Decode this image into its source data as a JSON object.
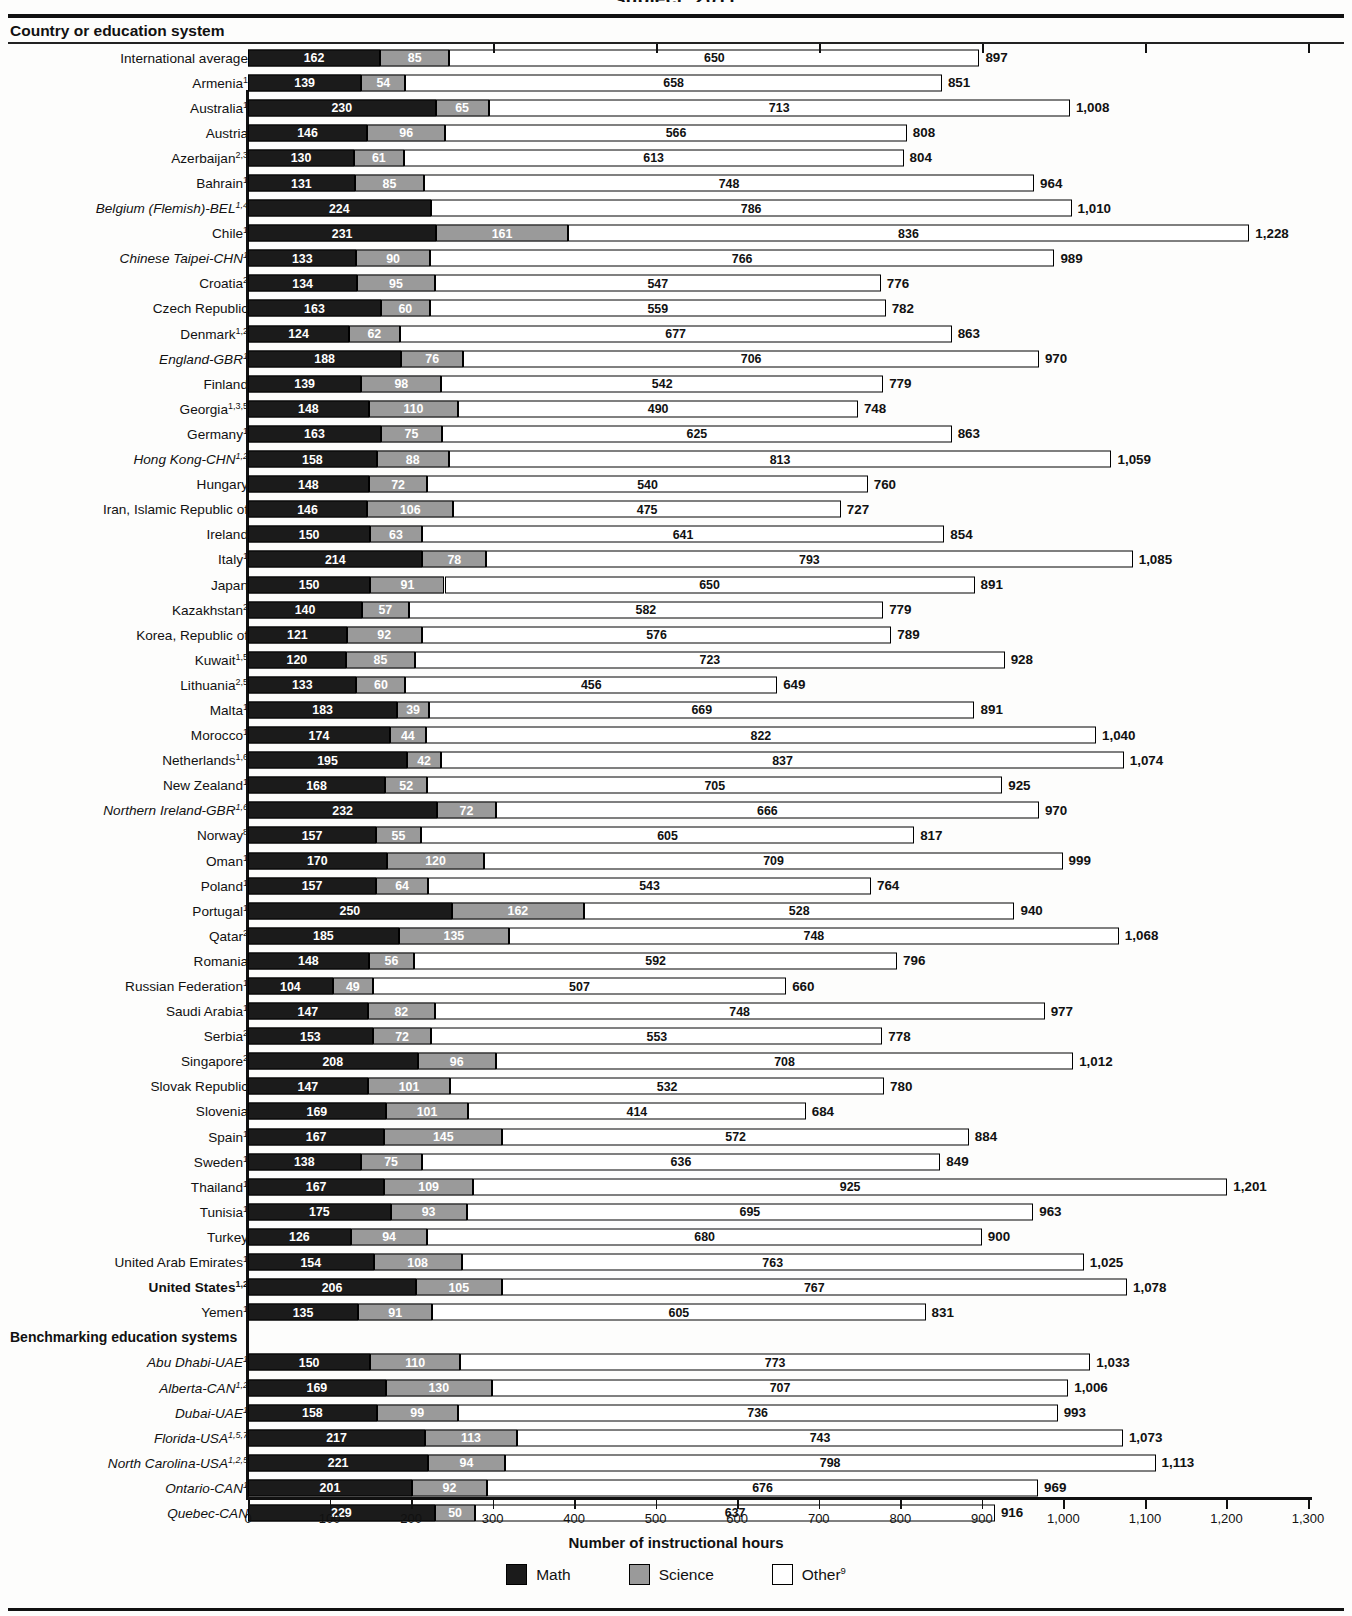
{
  "clipped_title": "subject: 2011",
  "column_header": "Country or education system",
  "axis": {
    "title": "Number of instructional hours",
    "ticks": [
      "0",
      "100",
      "200",
      "300",
      "400",
      "500",
      "600",
      "700",
      "800",
      "900",
      "1,000",
      "1,100",
      "1,200",
      "1,300"
    ],
    "min": 0,
    "max": 1300
  },
  "legend": [
    {
      "key": "math",
      "label": "Math",
      "color": "#1b1b1b",
      "sup": ""
    },
    {
      "key": "science",
      "label": "Science",
      "color": "#9a9a9a",
      "sup": ""
    },
    {
      "key": "other",
      "label": "Other",
      "color": "#ffffff",
      "sup": "9"
    }
  ],
  "group_header": "Benchmarking education systems",
  "chart_data": {
    "type": "bar",
    "subtype": "stacked-horizontal",
    "xlabel": "Number of instructional hours",
    "ylabel": "Country or education system",
    "xlim": [
      0,
      1300
    ],
    "grid": false,
    "legend_position": "bottom",
    "series": [
      {
        "name": "Math",
        "color": "#1b1b1b"
      },
      {
        "name": "Science",
        "color": "#9a9a9a"
      },
      {
        "name": "Other",
        "color": "#ffffff"
      }
    ],
    "categories": [
      "International average",
      "Armenia",
      "Australia",
      "Austria",
      "Azerbaijan",
      "Bahrain",
      "Belgium (Flemish)-BEL",
      "Chile",
      "Chinese Taipei-CHN",
      "Croatia",
      "Czech Republic",
      "Denmark",
      "England-GBR",
      "Finland",
      "Georgia",
      "Germany",
      "Hong Kong-CHN",
      "Hungary",
      "Iran, Islamic Republic of",
      "Ireland",
      "Italy",
      "Japan",
      "Kazakhstan",
      "Korea, Republic of",
      "Kuwait",
      "Lithuania",
      "Malta",
      "Morocco",
      "Netherlands",
      "New Zealand",
      "Northern Ireland-GBR",
      "Norway",
      "Oman",
      "Poland",
      "Portugal",
      "Qatar",
      "Romania",
      "Russian Federation",
      "Saudi Arabia",
      "Serbia",
      "Singapore",
      "Slovak Republic",
      "Slovenia",
      "Spain",
      "Sweden",
      "Thailand",
      "Tunisia",
      "Turkey",
      "United Arab Emirates",
      "United States",
      "Yemen",
      "Abu Dhabi-UAE",
      "Alberta-CAN",
      "Dubai-UAE",
      "Florida-USA",
      "North Carolina-USA",
      "Ontario-CAN",
      "Quebec-CAN"
    ],
    "rows": [
      {
        "label": "International average",
        "sup": "",
        "style": "plain",
        "math": 162,
        "science": 85,
        "other": 650,
        "total": 897
      },
      {
        "label": "Armenia",
        "sup": "1",
        "style": "plain",
        "math": 139,
        "science": 54,
        "other": 658,
        "total": 851
      },
      {
        "label": "Australia",
        "sup": "1",
        "style": "plain",
        "math": 230,
        "science": 65,
        "other": 713,
        "total": "1,008"
      },
      {
        "label": "Austria",
        "sup": "",
        "style": "plain",
        "math": 146,
        "science": 96,
        "other": 566,
        "total": 808
      },
      {
        "label": "Azerbaijan",
        "sup": "2,3",
        "style": "plain",
        "math": 130,
        "science": 61,
        "other": 613,
        "total": 804
      },
      {
        "label": "Bahrain",
        "sup": "1",
        "style": "plain",
        "math": 131,
        "science": 85,
        "other": 748,
        "total": 964
      },
      {
        "label": "Belgium (Flemish)-BEL",
        "sup": "1,4",
        "style": "ital",
        "math": 224,
        "science": 0,
        "other": 786,
        "total": "1,010"
      },
      {
        "label": "Chile",
        "sup": "1",
        "style": "plain",
        "math": 231,
        "science": 161,
        "other": 836,
        "total": "1,228"
      },
      {
        "label": "Chinese Taipei-CHN",
        "sup": "1",
        "style": "ital",
        "math": 133,
        "science": 90,
        "other": 766,
        "total": 989
      },
      {
        "label": "Croatia",
        "sup": "2",
        "style": "plain",
        "math": 134,
        "science": 95,
        "other": 547,
        "total": 776
      },
      {
        "label": "Czech Republic",
        "sup": "",
        "style": "plain",
        "math": 163,
        "science": 60,
        "other": 559,
        "total": 782
      },
      {
        "label": "Denmark",
        "sup": "1,2",
        "style": "plain",
        "math": 124,
        "science": 62,
        "other": 677,
        "total": 863
      },
      {
        "label": "England-GBR",
        "sup": "1",
        "style": "ital",
        "math": 188,
        "science": 76,
        "other": 706,
        "total": 970
      },
      {
        "label": "Finland",
        "sup": "",
        "style": "plain",
        "math": 139,
        "science": 98,
        "other": 542,
        "total": 779
      },
      {
        "label": "Georgia",
        "sup": "1,3,5",
        "style": "plain",
        "math": 148,
        "science": 110,
        "other": 490,
        "total": 748
      },
      {
        "label": "Germany",
        "sup": "1",
        "style": "plain",
        "math": 163,
        "science": 75,
        "other": 625,
        "total": 863
      },
      {
        "label": "Hong Kong-CHN",
        "sup": "1,2",
        "style": "ital",
        "math": 158,
        "science": 88,
        "other": 813,
        "total": "1,059"
      },
      {
        "label": "Hungary",
        "sup": "",
        "style": "plain",
        "math": 148,
        "science": 72,
        "other": 540,
        "total": 760
      },
      {
        "label": "Iran, Islamic Republic of",
        "sup": "",
        "style": "plain",
        "math": 146,
        "science": 106,
        "other": 475,
        "total": 727
      },
      {
        "label": "Ireland",
        "sup": "",
        "style": "plain",
        "math": 150,
        "science": 63,
        "other": 641,
        "total": 854
      },
      {
        "label": "Italy",
        "sup": "1",
        "style": "plain",
        "math": 214,
        "science": 78,
        "other": 793,
        "total": "1,085"
      },
      {
        "label": "Japan",
        "sup": "",
        "style": "plain",
        "math": 150,
        "science": 91,
        "other": 650,
        "total": 891
      },
      {
        "label": "Kazakhstan",
        "sup": "2",
        "style": "plain",
        "math": 140,
        "science": 57,
        "other": 582,
        "total": 779
      },
      {
        "label": "Korea, Republic of",
        "sup": "",
        "style": "plain",
        "math": 121,
        "science": 92,
        "other": 576,
        "total": 789
      },
      {
        "label": "Kuwait",
        "sup": "1,5",
        "style": "plain",
        "math": 120,
        "science": 85,
        "other": 723,
        "total": 928
      },
      {
        "label": "Lithuania",
        "sup": "2,5",
        "style": "plain",
        "math": 133,
        "science": 60,
        "other": 456,
        "total": 649
      },
      {
        "label": "Malta",
        "sup": "1",
        "style": "plain",
        "math": 183,
        "science": 39,
        "other": 669,
        "total": 891
      },
      {
        "label": "Morocco",
        "sup": "1",
        "style": "plain",
        "math": 174,
        "science": 44,
        "other": 822,
        "total": "1,040"
      },
      {
        "label": "Netherlands",
        "sup": "1,6",
        "style": "plain",
        "math": 195,
        "science": 42,
        "other": 837,
        "total": "1,074"
      },
      {
        "label": "New Zealand",
        "sup": "1",
        "style": "plain",
        "math": 168,
        "science": 52,
        "other": 705,
        "total": 925
      },
      {
        "label": "Northern Ireland-GBR",
        "sup": "1,6",
        "style": "ital",
        "math": 232,
        "science": 72,
        "other": 666,
        "total": 970
      },
      {
        "label": "Norway",
        "sup": "8",
        "style": "plain",
        "math": 157,
        "science": 55,
        "other": 605,
        "total": 817
      },
      {
        "label": "Oman",
        "sup": "1",
        "style": "plain",
        "math": 170,
        "science": 120,
        "other": 709,
        "total": 999
      },
      {
        "label": "Poland",
        "sup": "1",
        "style": "plain",
        "math": 157,
        "science": 64,
        "other": 543,
        "total": 764
      },
      {
        "label": "Portugal",
        "sup": "1",
        "style": "plain",
        "math": 250,
        "science": 162,
        "other": 528,
        "total": 940
      },
      {
        "label": "Qatar",
        "sup": "2",
        "style": "plain",
        "math": 185,
        "science": 135,
        "other": 748,
        "total": "1,068"
      },
      {
        "label": "Romania",
        "sup": "",
        "style": "plain",
        "math": 148,
        "science": 56,
        "other": 592,
        "total": 796
      },
      {
        "label": "Russian Federation",
        "sup": "1",
        "style": "plain",
        "math": 104,
        "science": 49,
        "other": 507,
        "total": 660
      },
      {
        "label": "Saudi Arabia",
        "sup": "1",
        "style": "plain",
        "math": 147,
        "science": 82,
        "other": 748,
        "total": 977
      },
      {
        "label": "Serbia",
        "sup": "2",
        "style": "plain",
        "math": 153,
        "science": 72,
        "other": 553,
        "total": 778
      },
      {
        "label": "Singapore",
        "sup": "2",
        "style": "plain",
        "math": 208,
        "science": 96,
        "other": 708,
        "total": "1,012"
      },
      {
        "label": "Slovak Republic",
        "sup": "",
        "style": "plain",
        "math": 147,
        "science": 101,
        "other": 532,
        "total": 780
      },
      {
        "label": "Slovenia",
        "sup": "",
        "style": "plain",
        "math": 169,
        "science": 101,
        "other": 414,
        "total": 684
      },
      {
        "label": "Spain",
        "sup": "1",
        "style": "plain",
        "math": 167,
        "science": 145,
        "other": 572,
        "total": 884
      },
      {
        "label": "Sweden",
        "sup": "1",
        "style": "plain",
        "math": 138,
        "science": 75,
        "other": 636,
        "total": 849
      },
      {
        "label": "Thailand",
        "sup": "1",
        "style": "plain",
        "math": 167,
        "science": 109,
        "other": 925,
        "total": "1,201"
      },
      {
        "label": "Tunisia",
        "sup": "1",
        "style": "plain",
        "math": 175,
        "science": 93,
        "other": 695,
        "total": 963
      },
      {
        "label": "Turkey",
        "sup": "",
        "style": "plain",
        "math": 126,
        "science": 94,
        "other": 680,
        "total": 900
      },
      {
        "label": "United Arab Emirates",
        "sup": "1",
        "style": "plain",
        "math": 154,
        "science": 108,
        "other": 763,
        "total": "1,025"
      },
      {
        "label": "United States",
        "sup": "1,2",
        "style": "bold",
        "math": 206,
        "science": 105,
        "other": 767,
        "total": "1,078"
      },
      {
        "label": "Yemen",
        "sup": "1",
        "style": "plain",
        "math": 135,
        "science": 91,
        "other": 605,
        "total": 831
      },
      {
        "label": "__GROUP__",
        "sup": "",
        "style": "group",
        "math": 0,
        "science": 0,
        "other": 0,
        "total": ""
      },
      {
        "label": "Abu Dhabi-UAE",
        "sup": "1",
        "style": "ital",
        "math": 150,
        "science": 110,
        "other": 773,
        "total": "1,033"
      },
      {
        "label": "Alberta-CAN",
        "sup": "1,2",
        "style": "ital",
        "math": 169,
        "science": 130,
        "other": 707,
        "total": "1,006"
      },
      {
        "label": "Dubai-UAE",
        "sup": "1",
        "style": "ital",
        "math": 158,
        "science": 99,
        "other": 736,
        "total": 993
      },
      {
        "label": "Florida-USA",
        "sup": "1,5,7",
        "style": "ital",
        "math": 217,
        "science": 113,
        "other": 743,
        "total": "1,073"
      },
      {
        "label": "North Carolina-USA",
        "sup": "1,2,5",
        "style": "ital",
        "math": 221,
        "science": 94,
        "other": 798,
        "total": "1,113"
      },
      {
        "label": "Ontario-CAN",
        "sup": "1",
        "style": "ital",
        "math": 201,
        "science": 92,
        "other": 676,
        "total": 969
      },
      {
        "label": "Quebec-CAN",
        "sup": "",
        "style": "ital",
        "math": 229,
        "science": 50,
        "other": 637,
        "total": 916
      }
    ]
  }
}
